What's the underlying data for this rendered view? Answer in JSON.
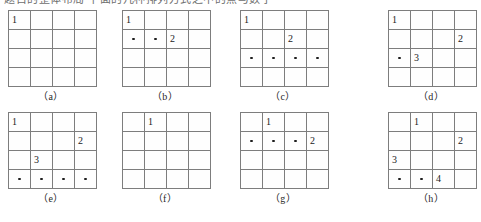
{
  "page": {
    "top_text": "题目的整体布局    下面的几种排列方式之中的点与数字",
    "grid_rows": 4,
    "grid_cols": 4,
    "line_color": "#7d7d7d",
    "dot_color": "#1d1d1d",
    "text_color": "#222222",
    "background": "#ffffff"
  },
  "figures": [
    {
      "id": "a",
      "label": "（a）",
      "row": 0,
      "left": 8,
      "cells": [
        {
          "r": 0,
          "c": 0,
          "type": "number",
          "value": "1"
        }
      ]
    },
    {
      "id": "b",
      "label": "（b）",
      "row": 0,
      "left": 122,
      "cells": [
        {
          "r": 0,
          "c": 0,
          "type": "number",
          "value": "1"
        },
        {
          "r": 1,
          "c": 0,
          "type": "dot",
          "value": ""
        },
        {
          "r": 1,
          "c": 1,
          "type": "dot",
          "value": ""
        },
        {
          "r": 1,
          "c": 2,
          "type": "number",
          "value": "2"
        }
      ]
    },
    {
      "id": "c",
      "label": "（c）",
      "row": 0,
      "left": 240,
      "cells": [
        {
          "r": 0,
          "c": 0,
          "type": "number",
          "value": "1"
        },
        {
          "r": 1,
          "c": 2,
          "type": "number",
          "value": "2"
        },
        {
          "r": 2,
          "c": 0,
          "type": "dot",
          "value": ""
        },
        {
          "r": 2,
          "c": 1,
          "type": "dot",
          "value": ""
        },
        {
          "r": 2,
          "c": 2,
          "type": "dot",
          "value": ""
        },
        {
          "r": 2,
          "c": 3,
          "type": "dot",
          "value": ""
        }
      ]
    },
    {
      "id": "d",
      "label": "（d）",
      "row": 0,
      "left": 388,
      "cells": [
        {
          "r": 0,
          "c": 0,
          "type": "number",
          "value": "1"
        },
        {
          "r": 1,
          "c": 3,
          "type": "number",
          "value": "2"
        },
        {
          "r": 2,
          "c": 0,
          "type": "dot",
          "value": ""
        },
        {
          "r": 2,
          "c": 1,
          "type": "number",
          "value": "3"
        }
      ]
    },
    {
      "id": "e",
      "label": "（e）",
      "row": 1,
      "left": 8,
      "cells": [
        {
          "r": 0,
          "c": 0,
          "type": "number",
          "value": "1"
        },
        {
          "r": 1,
          "c": 3,
          "type": "number",
          "value": "2"
        },
        {
          "r": 2,
          "c": 1,
          "type": "number",
          "value": "3"
        },
        {
          "r": 3,
          "c": 0,
          "type": "dot",
          "value": ""
        },
        {
          "r": 3,
          "c": 1,
          "type": "dot",
          "value": ""
        },
        {
          "r": 3,
          "c": 2,
          "type": "dot",
          "value": ""
        },
        {
          "r": 3,
          "c": 3,
          "type": "dot",
          "value": ""
        }
      ]
    },
    {
      "id": "f",
      "label": "（f）",
      "row": 1,
      "left": 122,
      "cells": [
        {
          "r": 0,
          "c": 1,
          "type": "number",
          "value": "1"
        }
      ]
    },
    {
      "id": "g",
      "label": "（g）",
      "row": 1,
      "left": 240,
      "cells": [
        {
          "r": 0,
          "c": 1,
          "type": "number",
          "value": "1"
        },
        {
          "r": 1,
          "c": 0,
          "type": "dot",
          "value": ""
        },
        {
          "r": 1,
          "c": 1,
          "type": "dot",
          "value": ""
        },
        {
          "r": 1,
          "c": 2,
          "type": "dot",
          "value": ""
        },
        {
          "r": 1,
          "c": 3,
          "type": "number",
          "value": "2"
        }
      ]
    },
    {
      "id": "h",
      "label": "（h）",
      "row": 1,
      "left": 388,
      "cells": [
        {
          "r": 0,
          "c": 1,
          "type": "number",
          "value": "1"
        },
        {
          "r": 1,
          "c": 3,
          "type": "number",
          "value": "2"
        },
        {
          "r": 2,
          "c": 0,
          "type": "number",
          "value": "3"
        },
        {
          "r": 3,
          "c": 0,
          "type": "dot",
          "value": ""
        },
        {
          "r": 3,
          "c": 1,
          "type": "dot",
          "value": ""
        },
        {
          "r": 3,
          "c": 2,
          "type": "number",
          "value": "4"
        }
      ]
    }
  ]
}
